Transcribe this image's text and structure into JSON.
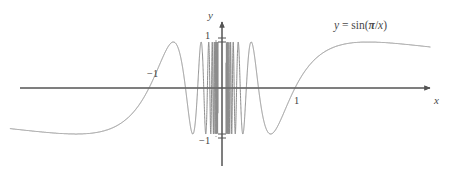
{
  "figure": {
    "background_color": "#ffffff",
    "curve_color": "#8c8c8c",
    "axis_color": "#555555",
    "text_color": "#4a4a4a",
    "width": 453,
    "height": 175,
    "equation_label": "y = sin(π/x)",
    "equation_parts": {
      "lhs": "y",
      "equals": "=",
      "fn": "sin(",
      "pi": "π",
      "slash": "/",
      "var": "x",
      "close": ")"
    },
    "axis_label_y": "y",
    "axis_label_x": "x",
    "tick_label_pos1": "1",
    "tick_label_neg1": "−1",
    "root_label_neg1": "−1",
    "root_label_pos1": "1"
  },
  "chart_data": {
    "type": "line",
    "title": "",
    "subtitle": "",
    "xlabel": "x",
    "ylabel": "y",
    "legend": [
      "y = sin(π/x)"
    ],
    "legend_position": "upper-right",
    "grid": false,
    "function": "y = sin(pi/x)",
    "xlim": [
      -2.9,
      2.85
    ],
    "ylim": [
      -1.45,
      1.45
    ],
    "x_ticks": [
      -1,
      1
    ],
    "x_tick_labels": [
      "−1",
      "1"
    ],
    "y_ticks": [
      -1,
      1
    ],
    "y_tick_labels": [
      "−1",
      "1"
    ],
    "annotations": [
      {
        "text": "y = sin(π/x)",
        "x": 1.75,
        "y": 1.33
      },
      {
        "text": "y",
        "x": -0.07,
        "y": 1.45
      },
      {
        "text": "x",
        "x": 2.84,
        "y": -0.18
      }
    ],
    "x": [
      -2.9,
      -2.8,
      -2.7,
      -2.6,
      -2.5,
      -2.4,
      -2.3,
      -2.2,
      -2.1,
      -2.0,
      -1.9,
      -1.8,
      -1.7,
      -1.6,
      -1.5,
      -1.4,
      -1.3,
      -1.2,
      -1.1,
      -1.0,
      -0.9,
      -0.8,
      -0.7,
      -0.65,
      -0.6,
      -0.55,
      -0.5,
      -0.45,
      -0.4,
      -0.36,
      -0.33,
      -0.3,
      -0.28,
      -0.25,
      -0.22,
      -0.2,
      -0.18,
      -0.16,
      -0.14,
      -0.12,
      -0.1,
      -0.08,
      -0.06,
      0.06,
      0.08,
      0.1,
      0.12,
      0.14,
      0.16,
      0.18,
      0.2,
      0.22,
      0.25,
      0.28,
      0.3,
      0.33,
      0.36,
      0.4,
      0.45,
      0.5,
      0.55,
      0.6,
      0.65,
      0.7,
      0.8,
      0.9,
      1.0,
      1.1,
      1.2,
      1.3,
      1.4,
      1.5,
      1.6,
      1.7,
      1.8,
      1.9,
      2.0,
      2.1,
      2.2,
      2.3,
      2.4,
      2.5,
      2.6,
      2.7,
      2.8,
      2.85
    ],
    "y": [
      -0.67,
      -0.69,
      -0.7,
      -0.72,
      -0.74,
      -0.76,
      -0.78,
      -0.81,
      -0.84,
      -0.87,
      -0.9,
      -0.94,
      -0.97,
      -1.0,
      -0.97,
      -0.9,
      -0.78,
      -0.61,
      -0.38,
      0.0,
      0.34,
      0.71,
      0.97,
      1.0,
      0.87,
      0.41,
      0.0,
      -0.74,
      -0.97,
      -0.27,
      0.39,
      1.0,
      0.78,
      0.0,
      -0.86,
      -0.95,
      0.17,
      1.0,
      0.23,
      -0.87,
      0.0,
      0.92,
      -0.28,
      0.28,
      -0.92,
      0.0,
      0.87,
      -0.23,
      -1.0,
      -0.17,
      0.95,
      0.86,
      0.0,
      -0.78,
      -1.0,
      -0.39,
      0.27,
      0.97,
      0.74,
      0.0,
      -0.41,
      -0.87,
      -1.0,
      -0.97,
      -0.71,
      -0.34,
      0.0,
      0.38,
      0.61,
      0.78,
      0.9,
      0.97,
      1.0,
      0.97,
      0.94,
      0.9,
      0.87,
      0.84,
      0.81,
      0.78,
      0.76,
      0.74,
      0.72,
      0.7,
      0.69,
      0.68
    ]
  }
}
